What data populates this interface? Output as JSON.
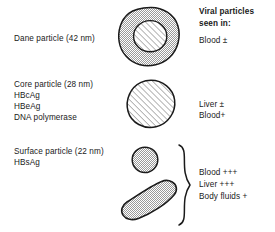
{
  "figure": {
    "title_column": {
      "header_line1": "Viral particles",
      "header_line2": "seen in:"
    }
  },
  "rows": [
    {
      "id": "dane",
      "left_labels": [
        "Dane particle (42 nm)"
      ],
      "particle": {
        "name": "dane-particle",
        "shape": "irregular-blob-with-inner-hatched-core",
        "outer_fill": "stipple-gray",
        "inner_fill": "diagonal-hatch",
        "size_label": "42 nm"
      },
      "right_labels": [
        "Blood ±"
      ]
    },
    {
      "id": "core",
      "left_labels": [
        "Core particle (28 nm)",
        "HBcAg",
        "HBeAg",
        "DNA polymerase"
      ],
      "particle": {
        "name": "core-particle",
        "shape": "circle-hatched",
        "outer_fill": "diagonal-hatch",
        "size_label": "28 nm"
      },
      "right_labels": [
        "Liver ±",
        "Blood+"
      ]
    },
    {
      "id": "surface",
      "left_labels": [
        "Surface particle (22 nm)",
        "HBsAg"
      ],
      "particles": [
        {
          "name": "surface-particle-sphere",
          "shape": "small-circle-stippled",
          "outer_fill": "stipple-gray",
          "size_label": "22 nm"
        },
        {
          "name": "surface-particle-filament",
          "shape": "curved-rod-stippled",
          "outer_fill": "stipple-gray"
        }
      ],
      "brace": "right-curly-brace",
      "right_labels": [
        "Blood +++",
        "Liver +++",
        "Body fluids +"
      ]
    }
  ],
  "colors": {
    "stroke": "#1a1a1a",
    "stipple_gray": "#b9b9b9",
    "hatch_line": "#3c3c3c",
    "text": "#1a1a1a",
    "background": "#ffffff"
  }
}
